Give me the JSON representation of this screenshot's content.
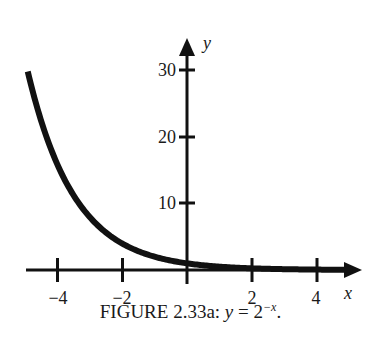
{
  "chart_data": {
    "type": "line",
    "function": "y = 2^(-x)",
    "xlabel": "x",
    "ylabel": "y",
    "xlim": [
      -4.9,
      5.3
    ],
    "ylim": [
      0,
      32
    ],
    "x_ticks": [
      -4,
      -2,
      2,
      4
    ],
    "x_tick_labels": [
      "−4",
      "−2",
      "2",
      "4"
    ],
    "y_ticks": [
      10,
      20,
      30
    ],
    "y_tick_labels": [
      "10",
      "20",
      "30"
    ],
    "grid": false,
    "legend": null,
    "series": [
      {
        "name": "y = 2^-x",
        "x": [
          -4.9,
          -4.5,
          -4,
          -3.5,
          -3,
          -2.5,
          -2,
          -1.5,
          -1,
          -0.5,
          0,
          1,
          2,
          3,
          4,
          5
        ],
        "y": [
          29.9,
          22.6,
          16,
          11.3,
          8,
          5.66,
          4,
          2.83,
          2,
          1.41,
          1,
          0.5,
          0.25,
          0.125,
          0.0625,
          0.03
        ]
      }
    ]
  },
  "caption": {
    "prefix": "FIGURE 2.33a: ",
    "math_lhs": "y",
    "equals": " = 2",
    "exponent": "−x",
    "suffix": "."
  }
}
